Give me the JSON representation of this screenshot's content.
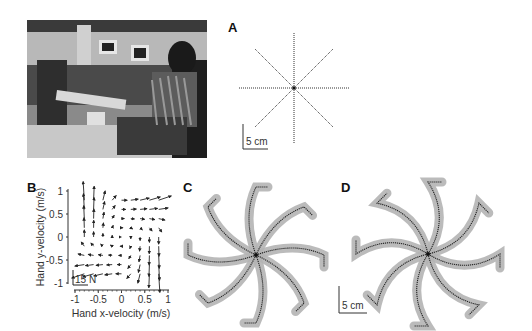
{
  "figure": {
    "panel_labels": {
      "a": "A",
      "b": "B",
      "c": "C",
      "d": "D"
    },
    "photo": {
      "description": "Subject seated holding robotic manipulandum handle in laboratory"
    },
    "panel_a": {
      "scale_bar_label": "5 cm",
      "n_directions": 8
    },
    "panel_c": {
      "n_directions": 8,
      "shading_color": "#b4b4b4"
    },
    "panel_d": {
      "scale_bar_label": "5 cm",
      "n_directions": 8,
      "shading_color": "#b4b4b4"
    }
  },
  "chart_data": [
    {
      "panel": "B",
      "type": "vector-field",
      "title": "",
      "xlabel": "Hand x-velocity (m/s)",
      "ylabel": "Hand y-velocity (m/s)",
      "xlim": [
        -1,
        1
      ],
      "ylim": [
        -1,
        1
      ],
      "xticks": [
        "-1",
        "-0.5",
        "0",
        "0.5",
        "1"
      ],
      "yticks": [
        "1",
        "0.5",
        "0",
        "-0.5",
        "-1"
      ],
      "force_scale_label": "15 N",
      "field": "saddle-shaped velocity-dependent curl field: F = B·v with vectors pointing up on left, right along top, down on right, left along bottom",
      "grid_x": [
        -0.8,
        -0.6,
        -0.4,
        -0.2,
        0,
        0.2,
        0.4,
        0.6,
        0.8
      ],
      "grid_y": [
        0.8,
        0.6,
        0.4,
        0.2,
        0,
        -0.2,
        -0.4,
        -0.6,
        -0.8
      ]
    }
  ]
}
